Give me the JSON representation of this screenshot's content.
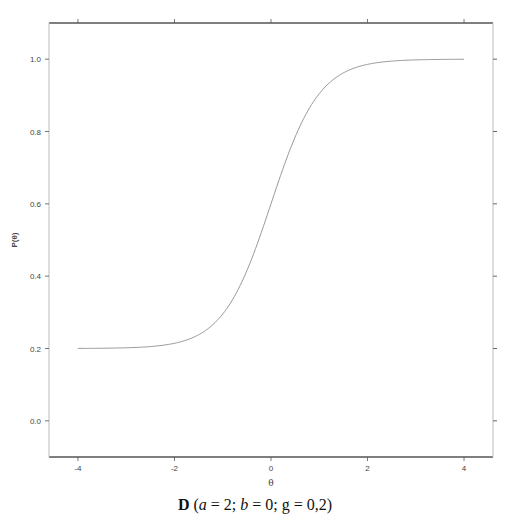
{
  "chart_data": {
    "type": "line",
    "title": "",
    "xlabel": "θ",
    "ylabel": "P(θ)",
    "xlim": [
      -4.6,
      4.6
    ],
    "ylim": [
      -0.1,
      1.1
    ],
    "grid": false,
    "legend": null,
    "x_ticks": [
      -4,
      -2,
      0,
      2,
      4
    ],
    "x_tick_labels": [
      "-4",
      "-2",
      "0",
      "2",
      "4"
    ],
    "y_ticks": [
      0.0,
      0.2,
      0.4,
      0.6,
      0.8,
      1.0
    ],
    "y_tick_labels": [
      "0.0",
      "0.2",
      "0.4",
      "0.6",
      "0.8",
      "1.0"
    ],
    "model": "3PL item characteristic curve: P(θ) = g + (1 - g) / (1 + exp(-a(θ - b)))",
    "parameters": {
      "a": 2,
      "b": 0,
      "g": 0.2
    },
    "series": [
      {
        "name": "ICC",
        "color": "#9a9a9a",
        "x": [
          -4,
          -3.5,
          -3,
          -2.5,
          -2,
          -1.5,
          -1,
          -0.75,
          -0.5,
          -0.25,
          0,
          0.25,
          0.5,
          0.75,
          1,
          1.5,
          2,
          2.5,
          3,
          3.5,
          4
        ],
        "y": [
          0.2,
          0.201,
          0.202,
          0.205,
          0.215,
          0.238,
          0.295,
          0.346,
          0.415,
          0.498,
          0.6,
          0.702,
          0.785,
          0.854,
          0.905,
          0.962,
          0.985,
          0.995,
          0.998,
          0.999,
          1.0
        ]
      }
    ],
    "caption": {
      "letter": "D",
      "text": "(a = 2; b = 0; g = 0,2)",
      "parts": [
        {
          "text": " (",
          "style": "normal"
        },
        {
          "text": "a",
          "style": "italic"
        },
        {
          "text": " = 2; ",
          "style": "normal"
        },
        {
          "text": "b",
          "style": "italic"
        },
        {
          "text": " = 0; g = 0,2)",
          "style": "normal"
        }
      ]
    }
  },
  "colors": {
    "frame": "#555555",
    "tick": "#555555",
    "curve": "#9a9a9a",
    "background": "#ffffff"
  }
}
